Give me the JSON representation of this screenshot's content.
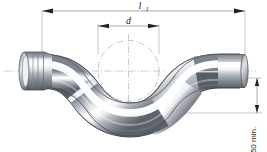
{
  "drawing": {
    "title": "S-bend pipe technical drawing",
    "background_color": "#ffffff",
    "line_color": "#555555",
    "text_color": "#1a1a1a",
    "metal_dark": "#6e757c",
    "metal_mid": "#b9c0c6",
    "metal_light": "#ffffff",
    "metal_edge": "#4d545b"
  },
  "dimensions": {
    "length_label": "l",
    "length_subscript": "1",
    "diameter_label": "d",
    "offset_label": "50 min."
  },
  "annotations": {
    "length_name": "overall-length-dimension",
    "diameter_name": "bend-diameter-dimension",
    "offset_name": "minimum-offset-dimension",
    "construction_circle": "bend-radius-construction-circle",
    "centerline": "pipe-axis-centerline"
  },
  "parts": {
    "socket_end": "flared socket end",
    "plain_end": "plain cut end",
    "body": "S-shaped pipe body"
  }
}
